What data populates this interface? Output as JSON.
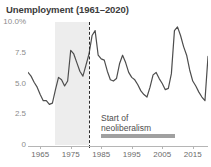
{
  "chart_data": {
    "type": "line",
    "title": "Unemployment (1961–2020)",
    "xlabel": "",
    "ylabel": "",
    "ylim": [
      0,
      10
    ],
    "xlim": [
      1961,
      2020
    ],
    "grid": false,
    "legend": "none",
    "y_tick_labels": [
      "10.0%",
      "7.5",
      "5.0",
      "2.5",
      "0"
    ],
    "y_tick_values": [
      10,
      7.5,
      5,
      2.5,
      0
    ],
    "x_tick_labels": [
      "1965",
      "1975",
      "1985",
      "1995",
      "2005",
      "2015"
    ],
    "x_tick_values": [
      1965,
      1975,
      1985,
      1995,
      2005,
      2015
    ],
    "series": [
      {
        "name": "Unemployment rate",
        "color": "#4d4d4d",
        "x": [
          1961,
          1962,
          1963,
          1964,
          1965,
          1966,
          1967,
          1968,
          1969,
          1970,
          1971,
          1972,
          1973,
          1974,
          1975,
          1976,
          1977,
          1978,
          1979,
          1980,
          1981,
          1982,
          1983,
          1984,
          1985,
          1986,
          1987,
          1988,
          1989,
          1990,
          1991,
          1992,
          1993,
          1994,
          1995,
          1996,
          1997,
          1998,
          1999,
          2000,
          2001,
          2002,
          2003,
          2004,
          2005,
          2006,
          2007,
          2008,
          2009,
          2010,
          2011,
          2012,
          2013,
          2014,
          2015,
          2016,
          2017,
          2018,
          2019,
          2020
        ],
        "values": [
          5.9,
          5.6,
          5.1,
          4.7,
          4.1,
          3.6,
          3.6,
          3.3,
          3.4,
          4.5,
          5.5,
          5.3,
          4.8,
          5.2,
          7.7,
          7.4,
          6.7,
          6.0,
          5.6,
          6.5,
          7.4,
          8.9,
          9.3,
          7.3,
          7.0,
          6.9,
          6.0,
          5.3,
          5.2,
          5.4,
          6.6,
          7.3,
          6.7,
          5.9,
          5.5,
          5.3,
          4.9,
          4.4,
          4.1,
          3.9,
          4.7,
          5.7,
          5.9,
          5.4,
          5.0,
          4.5,
          4.6,
          5.8,
          9.3,
          9.6,
          8.9,
          8.0,
          7.3,
          6.1,
          5.2,
          4.8,
          4.3,
          3.9,
          3.6,
          7.2
        ]
      }
    ],
    "shaded_region": {
      "label": "",
      "x_start": 1970,
      "x_end": 1981,
      "color": "#ededed"
    },
    "event_marker": {
      "x": 1981,
      "style": "dashed-vertical",
      "color": "#2b2b2b"
    },
    "annotation": {
      "line1": "Start of",
      "line2": "neoliberalism",
      "underline_color": "#a0a0a0"
    }
  },
  "chart": {
    "title": "Unemployment (1961–2020)",
    "annotation_line1": "Start of",
    "annotation_line2": "neoliberalism",
    "line_color": "#4d4d4d",
    "band_color": "#ededed",
    "axis_color": "#b5b5b5"
  }
}
